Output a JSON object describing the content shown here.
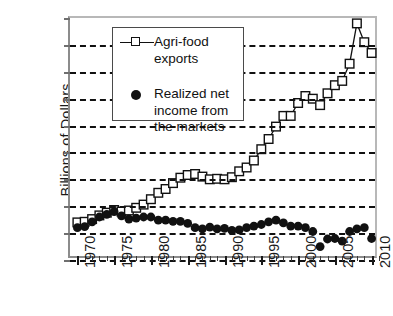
{
  "chart_data": {
    "type": "line",
    "title": "",
    "xlabel": "",
    "ylabel": "Billions of Dollars",
    "xlim": [
      1969,
      2011
    ],
    "ylim": [
      -5,
      40
    ],
    "ytick_values": [
      40,
      35,
      30,
      25,
      20,
      15,
      10,
      5,
      0,
      -5
    ],
    "ytick_labels": [
      "$40",
      "$35",
      "$30",
      "$25",
      "$20",
      "$15",
      "$10",
      "$5",
      "$0",
      "-$5"
    ],
    "xtick_values": [
      1970,
      1975,
      1980,
      1985,
      1990,
      1995,
      2000,
      2005,
      2010
    ],
    "xtick_labels": [
      "1970",
      "1975",
      "1980",
      "1985",
      "1990",
      "1995",
      "2000",
      "2005",
      "2010"
    ],
    "grid": "horizontal-dashed",
    "legend_position": "upper-left-inside",
    "x": [
      1970,
      1971,
      1972,
      1973,
      1974,
      1975,
      1976,
      1977,
      1978,
      1979,
      1980,
      1981,
      1982,
      1983,
      1984,
      1985,
      1986,
      1987,
      1988,
      1989,
      1990,
      1991,
      1992,
      1993,
      1994,
      1995,
      1996,
      1997,
      1998,
      1999,
      2000,
      2001,
      2002,
      2003,
      2004,
      2005,
      2006,
      2007,
      2008,
      2009,
      2010
    ],
    "series": [
      {
        "name": "Agri-food exports",
        "marker": "open-square",
        "line": true,
        "color": "#111111",
        "values": [
          2.0,
          2.1,
          2.6,
          3.3,
          3.8,
          4.3,
          4.0,
          4.2,
          4.7,
          5.3,
          6.3,
          7.5,
          8.2,
          9.3,
          10.3,
          10.8,
          11.0,
          10.5,
          10.0,
          10.1,
          10.0,
          10.4,
          11.5,
          12.2,
          13.5,
          15.6,
          17.5,
          19.8,
          21.8,
          21.8,
          24.2,
          25.5,
          25.0,
          23.8,
          26.0,
          27.5,
          28.3,
          31.5,
          39.0,
          35.5,
          33.5
        ]
      },
      {
        "name": "Realized net income from the markets",
        "marker": "filled-circle",
        "line": false,
        "color": "#111111",
        "values": [
          1.0,
          1.2,
          2.1,
          3.0,
          3.5,
          4.0,
          3.2,
          2.6,
          2.8,
          3.0,
          3.0,
          2.4,
          2.4,
          2.2,
          2.2,
          1.8,
          1.0,
          0.8,
          1.1,
          0.8,
          0.9,
          0.5,
          0.6,
          1.0,
          1.3,
          1.6,
          2.1,
          2.4,
          1.9,
          1.3,
          1.3,
          1.0,
          0.3,
          -2.5,
          -1.1,
          -1.0,
          -1.5,
          0.3,
          0.8,
          1.0,
          -1.0
        ]
      }
    ]
  },
  "legend": {
    "items": [
      {
        "label": "Agri-food exports"
      },
      {
        "label": "Realized net income from the markets"
      }
    ]
  }
}
